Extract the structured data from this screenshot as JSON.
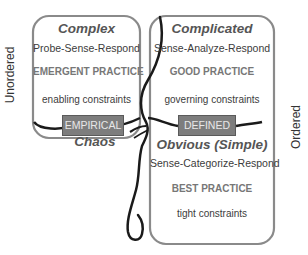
{
  "axes": {
    "left": "Unordered",
    "right": "Ordered"
  },
  "domains": {
    "complex": {
      "title": "Complex",
      "method": "Probe-Sense-Respond",
      "practice": "EMERGENT PRACTICE",
      "constraints": "enabling constraints"
    },
    "complicated": {
      "title": "Complicated",
      "method": "Sense-Analyze-Respond",
      "practice": "GOOD PRACTICE",
      "constraints": "governing constraints"
    },
    "chaos": {
      "title": "Chaos"
    },
    "obvious": {
      "title": "Obvious (Simple)",
      "method": "Sense-Categorize-Respond",
      "practice": "BEST PRACTICE",
      "constraints": "tight constraints"
    }
  },
  "tags": {
    "empirical": "EMPIRICAL",
    "defined": "DEFINED"
  },
  "colors": {
    "box_stroke": "#8a8a8a",
    "tag_fill": "#7d7d7d",
    "boundary_line": "#1a1a1a"
  }
}
